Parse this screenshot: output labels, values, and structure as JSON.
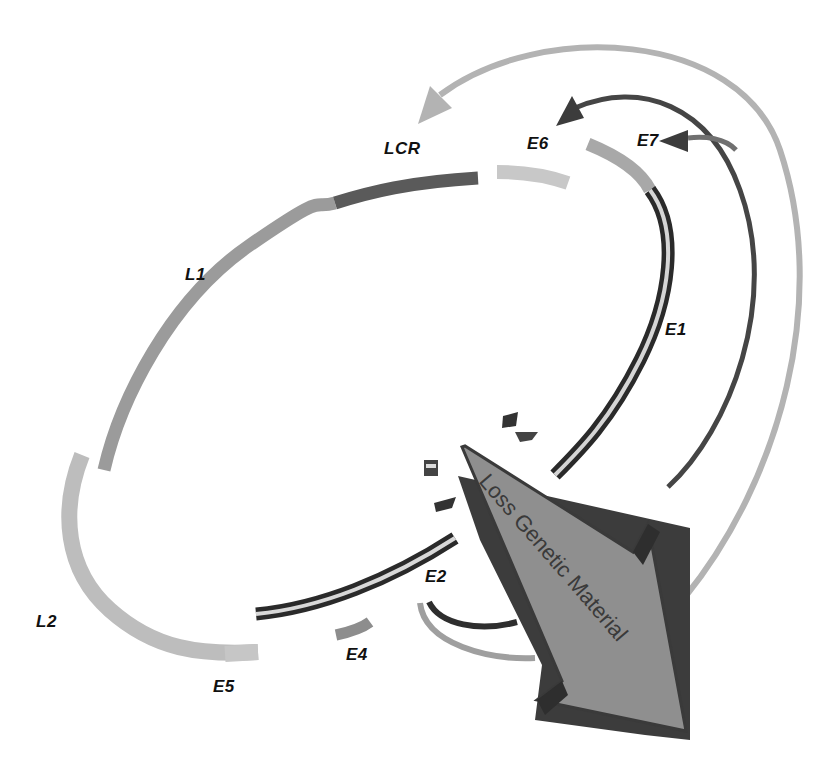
{
  "diagram": {
    "type": "HPV circular genome with genetic material loss",
    "labels": {
      "lcr": "LCR",
      "e6": "E6",
      "e7": "E7",
      "e1": "E1",
      "e2": "E2",
      "e4": "E4",
      "e5": "E5",
      "l1": "L1",
      "l2": "L2"
    },
    "big_arrow_text": "Loss Genetic Material",
    "colors": {
      "light_gray": "#b9b9b9",
      "mid_gray": "#9a9a9a",
      "dark_gray": "#4a4a4a",
      "arrow_fill": "#8f8f8f",
      "arrow_shadow": "#3c3c3c"
    }
  }
}
